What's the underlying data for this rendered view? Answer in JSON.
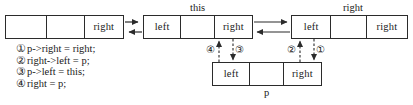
{
  "diagram": {
    "title_labels": {
      "this": "this",
      "right": "right",
      "p": "p"
    },
    "nodes": [
      {
        "id": "prev",
        "name": "previous-node",
        "cells": [
          "",
          "",
          "right"
        ]
      },
      {
        "id": "this",
        "name": "this-node",
        "label": "this",
        "cells": [
          "left",
          "",
          "right"
        ]
      },
      {
        "id": "right",
        "name": "right-node",
        "label": "right",
        "cells": [
          "left",
          "",
          "right"
        ]
      },
      {
        "id": "p",
        "name": "p-node",
        "label": "p",
        "cells": [
          "left",
          "",
          "right"
        ]
      }
    ],
    "step_markers": [
      {
        "id": "1",
        "glyph": "①"
      },
      {
        "id": "2",
        "glyph": "②"
      },
      {
        "id": "3",
        "glyph": "③"
      },
      {
        "id": "4",
        "glyph": "④"
      }
    ],
    "legend": [
      {
        "num": "①",
        "code": "p->right = right;"
      },
      {
        "num": "②",
        "code": "right->left = p;"
      },
      {
        "num": "③",
        "code": "p->left = this;"
      },
      {
        "num": "④",
        "code": "right = p;"
      }
    ],
    "colors": {
      "stroke": "#2b2b2b",
      "text": "#1a1a1a",
      "background": "#ffffff"
    }
  }
}
